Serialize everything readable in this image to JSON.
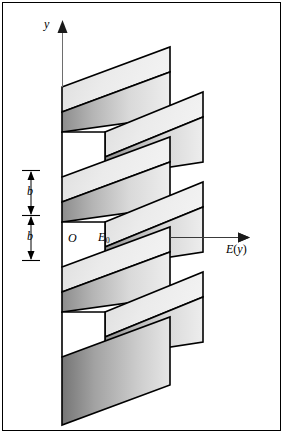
{
  "figure": {
    "kind": "3d-staircase-energy-band-diagram",
    "background_color": "#ffffff",
    "line_color": "#000000",
    "frame": {
      "visible": true,
      "color": "#000000",
      "x": 2,
      "y": 2,
      "width": 279,
      "height": 429
    },
    "axes": {
      "vertical": {
        "name": "y-axis",
        "label": "y",
        "x": 62,
        "y_top": 22,
        "y_bottom": 420,
        "arrow": "up"
      },
      "horizontal": {
        "name": "E-axis",
        "label": "E(y)",
        "label_base": "E",
        "label_arg": "(y)",
        "y": 237,
        "x_left": 62,
        "x_right": 250,
        "arrow": "right"
      },
      "origin_label": "O",
      "origin": {
        "x": 62,
        "y": 237
      },
      "reference_value_label": "E",
      "reference_value_sub": "0",
      "reference_value_x": 148
    },
    "dimension_ticks": {
      "name": "period-dimension-stack",
      "x": 31,
      "tick_half_width": 9,
      "ticks_y": [
        170,
        215,
        260
      ],
      "segments": [
        {
          "label": "b",
          "y_top": 170,
          "y_bottom": 215
        },
        {
          "label": "b",
          "y_top": 215,
          "y_bottom": 260
        }
      ]
    },
    "slabs": {
      "count": 5,
      "period": 90,
      "left_x": 62,
      "notch_x": 105,
      "right_x_long": 203,
      "right_x_short": 170,
      "top_face_fill": "#ececec",
      "front_face_fill_left": "#9b9b9b",
      "front_face_fill_right": "#e4e4e4",
      "edge_color": "#000000",
      "items": [
        {
          "index": 0,
          "y_front_left": 132,
          "right_x": 170,
          "has_top_face": true,
          "partial": "top-clipped"
        },
        {
          "index": 1,
          "y_front_left": 177,
          "right_x": 203,
          "has_top_face": true,
          "partial": "none"
        },
        {
          "index": 2,
          "y_front_left": 222,
          "right_x": 170,
          "has_top_face": true,
          "partial": "none"
        },
        {
          "index": 3,
          "y_front_left": 267,
          "right_x": 203,
          "has_top_face": true,
          "partial": "none"
        },
        {
          "index": 4,
          "y_front_left": 312,
          "right_x": 170,
          "has_top_face": true,
          "partial": "none"
        },
        {
          "index": 5,
          "y_front_left": 357,
          "right_x": 203,
          "has_top_face": false,
          "partial": "bottom-solid"
        }
      ]
    }
  }
}
